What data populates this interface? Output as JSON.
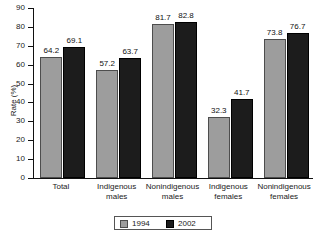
{
  "chart_data": {
    "type": "bar",
    "title": "",
    "xlabel": "",
    "ylabel": "Rate (%)",
    "ylim": [
      0,
      90
    ],
    "ytick_labels": [
      "0",
      "10",
      "20",
      "30",
      "40",
      "50",
      "60",
      "70",
      "80",
      "90"
    ],
    "yticks": [
      0,
      10,
      20,
      30,
      40,
      50,
      60,
      70,
      80,
      90
    ],
    "grid": false,
    "legend_position": "bottom-center",
    "categories": [
      "Total",
      "Indigenous males",
      "Nonindigenous males",
      "Indigenous females",
      "Nonindigenous females"
    ],
    "category_lines": [
      [
        "Total"
      ],
      [
        "Indigenous",
        "males"
      ],
      [
        "Nonindigenous",
        "males"
      ],
      [
        "Indigenous",
        "females"
      ],
      [
        "Nonindigenous",
        "females"
      ]
    ],
    "series": [
      {
        "name": "1994",
        "color": "#9d9d9d",
        "values": [
          64.2,
          57.2,
          81.7,
          32.3,
          73.8
        ],
        "labels": [
          "64.2",
          "57.2",
          "81.7",
          "32.3",
          "73.8"
        ]
      },
      {
        "name": "2002",
        "color": "#1c1c1c",
        "values": [
          69.1,
          63.7,
          82.8,
          41.7,
          76.7
        ],
        "labels": [
          "69.1",
          "63.7",
          "82.8",
          "41.7",
          "76.7"
        ]
      }
    ]
  },
  "legend": {
    "items": [
      {
        "label": "1994",
        "color": "#9d9d9d"
      },
      {
        "label": "2002",
        "color": "#1c1c1c"
      }
    ]
  },
  "colors": {
    "series_1994": "#9d9d9d",
    "series_2002": "#1c1c1c",
    "axis": "#111111",
    "text": "#1a1a1a",
    "background": "#ffffff"
  }
}
